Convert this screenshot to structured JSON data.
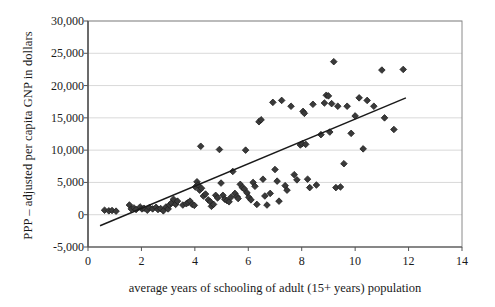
{
  "chart_data": {
    "type": "scatter",
    "title": "",
    "xlabel": "average years of schooling of adult (15+ years) population",
    "ylabel": "PPP – adjusted per capita GNP in dollars",
    "xlim": [
      0,
      14
    ],
    "ylim": [
      -5000,
      30000
    ],
    "xticks": [
      "0",
      "2",
      "4",
      "6",
      "8",
      "10",
      "12",
      "14"
    ],
    "xtick_values": [
      0,
      2,
      4,
      6,
      8,
      10,
      12,
      14
    ],
    "yticks": [
      "-5,000",
      "0",
      "5,000",
      "10,000",
      "15,000",
      "20,000",
      "25,000",
      "30,000"
    ],
    "ytick_values": [
      -5000,
      0,
      5000,
      10000,
      15000,
      20000,
      25000,
      30000
    ],
    "grid": "horizontal",
    "legend": "none",
    "marker": "diamond",
    "marker_color": "#3a3a3a",
    "trendline": {
      "label": "linear fit",
      "x": [
        0.45,
        11.9
      ],
      "y": [
        -1700,
        18100
      ],
      "color": "#1a1a1a"
    },
    "points": [
      [
        0.62,
        700
      ],
      [
        0.78,
        600
      ],
      [
        0.9,
        650
      ],
      [
        1.05,
        550
      ],
      [
        1.55,
        1500
      ],
      [
        1.62,
        900
      ],
      [
        1.72,
        1050
      ],
      [
        1.8,
        800
      ],
      [
        1.95,
        1200
      ],
      [
        2.02,
        900
      ],
      [
        2.1,
        1000
      ],
      [
        2.22,
        700
      ],
      [
        2.3,
        1100
      ],
      [
        2.42,
        900
      ],
      [
        2.55,
        1150
      ],
      [
        2.62,
        800
      ],
      [
        2.72,
        950
      ],
      [
        2.82,
        600
      ],
      [
        2.92,
        1200
      ],
      [
        3.0,
        900
      ],
      [
        3.05,
        1500
      ],
      [
        3.12,
        1800
      ],
      [
        3.2,
        2400
      ],
      [
        3.28,
        1600
      ],
      [
        3.35,
        2100
      ],
      [
        3.55,
        1500
      ],
      [
        3.68,
        1700
      ],
      [
        3.75,
        1900
      ],
      [
        3.82,
        2100
      ],
      [
        3.9,
        1600
      ],
      [
        3.98,
        1450
      ],
      [
        4.02,
        4300
      ],
      [
        4.08,
        5100
      ],
      [
        4.12,
        4600
      ],
      [
        4.18,
        3800
      ],
      [
        4.22,
        10600
      ],
      [
        4.25,
        4100
      ],
      [
        4.32,
        2900
      ],
      [
        4.4,
        3200
      ],
      [
        4.5,
        2300
      ],
      [
        4.58,
        2000
      ],
      [
        4.62,
        1300
      ],
      [
        4.7,
        1600
      ],
      [
        4.78,
        3000
      ],
      [
        4.85,
        2600
      ],
      [
        4.92,
        10100
      ],
      [
        4.98,
        4900
      ],
      [
        5.05,
        3000
      ],
      [
        5.12,
        2400
      ],
      [
        5.2,
        2200
      ],
      [
        5.28,
        2000
      ],
      [
        5.35,
        2700
      ],
      [
        5.42,
        6700
      ],
      [
        5.5,
        3300
      ],
      [
        5.58,
        2800
      ],
      [
        5.62,
        2500
      ],
      [
        5.7,
        4700
      ],
      [
        5.78,
        4200
      ],
      [
        5.85,
        4000
      ],
      [
        5.9,
        10000
      ],
      [
        5.95,
        3400
      ],
      [
        6.02,
        2700
      ],
      [
        6.1,
        2300
      ],
      [
        6.18,
        5000
      ],
      [
        6.25,
        4400
      ],
      [
        6.32,
        1600
      ],
      [
        6.4,
        14400
      ],
      [
        6.48,
        14700
      ],
      [
        6.55,
        5500
      ],
      [
        6.62,
        2900
      ],
      [
        6.7,
        1500
      ],
      [
        6.82,
        3300
      ],
      [
        6.92,
        17400
      ],
      [
        7.0,
        7000
      ],
      [
        7.08,
        5200
      ],
      [
        7.15,
        2100
      ],
      [
        7.25,
        17700
      ],
      [
        7.38,
        4500
      ],
      [
        7.45,
        3800
      ],
      [
        7.6,
        16800
      ],
      [
        7.72,
        6200
      ],
      [
        7.82,
        5400
      ],
      [
        7.95,
        10800
      ],
      [
        8.02,
        11000
      ],
      [
        8.05,
        16000
      ],
      [
        8.1,
        15700
      ],
      [
        8.15,
        10900
      ],
      [
        8.22,
        5500
      ],
      [
        8.3,
        4200
      ],
      [
        8.42,
        17100
      ],
      [
        8.55,
        4600
      ],
      [
        8.72,
        12400
      ],
      [
        8.85,
        17300
      ],
      [
        8.92,
        18500
      ],
      [
        9.0,
        18400
      ],
      [
        9.05,
        12800
      ],
      [
        9.12,
        17200
      ],
      [
        9.2,
        23700
      ],
      [
        9.28,
        4200
      ],
      [
        9.35,
        16800
      ],
      [
        9.45,
        4300
      ],
      [
        9.58,
        7900
      ],
      [
        9.7,
        16800
      ],
      [
        9.85,
        12600
      ],
      [
        10.0,
        15300
      ],
      [
        10.15,
        18100
      ],
      [
        10.3,
        10200
      ],
      [
        10.45,
        17700
      ],
      [
        10.7,
        16800
      ],
      [
        11.0,
        22400
      ],
      [
        11.1,
        15000
      ],
      [
        11.45,
        13200
      ],
      [
        11.8,
        22500
      ]
    ]
  },
  "axes_geometry": {
    "note": "pixel frame of plot area",
    "left": 88,
    "right": 462,
    "top": 21,
    "bottom": 247
  }
}
